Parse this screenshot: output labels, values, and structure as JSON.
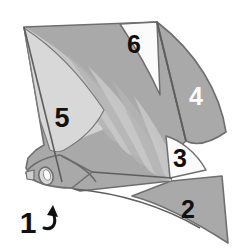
{
  "figure": {
    "background_color": "#ffffff",
    "canvas": {
      "width": 243,
      "height": 249
    }
  },
  "palette": {
    "outline": "#6f6f6f",
    "outline_dark": "#585858",
    "body_mid_gray": "#a9a9a9",
    "body_light_gray": "#d2d2d2",
    "body_lighter_gray": "#dddddd",
    "ray_band_light": "#c9c9c9",
    "ray_band_mid": "#b4b4b4",
    "panel_white": "#fbfbfb",
    "label_dark": "#111111",
    "label_light": "#ffffff",
    "arrow_color": "#111111"
  },
  "labels": [
    {
      "id": "label-1",
      "text": "1",
      "x": 28,
      "y": 225,
      "font_size": 30,
      "color": "#111111",
      "region": "oval-feature",
      "has_arrow": true
    },
    {
      "id": "label-2",
      "text": "2",
      "x": 188,
      "y": 211,
      "font_size": 25,
      "color": "#111111",
      "region": "lower-right-lobe",
      "has_arrow": false
    },
    {
      "id": "label-3",
      "text": "3",
      "x": 180,
      "y": 160,
      "font_size": 25,
      "color": "#111111",
      "region": "white-wedge-notch",
      "has_arrow": false
    },
    {
      "id": "label-4",
      "text": "4",
      "x": 196,
      "y": 98,
      "font_size": 25,
      "color": "#ffffff",
      "region": "right-lobe",
      "has_arrow": false
    },
    {
      "id": "label-5",
      "text": "5",
      "x": 62,
      "y": 120,
      "font_size": 27,
      "color": "#111111",
      "region": "left-light-band",
      "has_arrow": false
    },
    {
      "id": "label-6",
      "text": "6",
      "x": 134,
      "y": 46,
      "font_size": 25,
      "color": "#111111",
      "region": "upper-light-panel",
      "has_arrow": false
    }
  ],
  "arrow": {
    "name": "callout-arrow-1",
    "path": "M 44 228 C 54 231 57 222 53 213",
    "head_points": "53,205 58,217 47,215",
    "color": "#111111",
    "stroke_width": 3
  },
  "shapes": {
    "main_body": {
      "name": "main-body-outline",
      "path": "M 24 27 L 157 22 L 186 141 L 176 150 L 171 181 L 80 191 L 54 182 L 32 177 L 26 168 L 28 158 L 36 150 L 44 145 L 24 27 Z",
      "fill": "#a9a9a9"
    },
    "left_panel": {
      "name": "left-light-panel",
      "path": "M 24 27 C 56 45 92 78 122 122 L 52 150 Z",
      "fill": "#d2d2d2"
    },
    "upper_panel": {
      "name": "upper-light-panel",
      "path": "M 120 24 L 157 22 L 160 95 C 146 64 132 42 120 24 Z",
      "fill": "#fbfbfb"
    },
    "right_lobe": {
      "name": "right-lobe",
      "path": "M 157 22 C 196 52 220 92 226 132 C 210 143 196 146 186 141 Z",
      "fill": "#a9a9a9"
    },
    "lower_right_lobe": {
      "name": "lower-right-lobe",
      "path": "M 171 181 L 222 176 L 228 243 C 200 225 166 205 132 196 Z",
      "fill": "#a9a9a9"
    },
    "white_wedge": {
      "name": "white-wedge-notch",
      "path": "M 166 136 C 180 140 196 152 206 170 L 170 178 Z",
      "fill": "#fbfbfb"
    },
    "head_lobe": {
      "name": "head-lobe",
      "path": "M 60 155 C 44 157 30 165 26 173 C 31 182 50 188 72 188 L 92 172 Z",
      "fill": "#a9a9a9"
    },
    "oval_feature": {
      "name": "oval-feature",
      "cx": 46,
      "cy": 176,
      "rx": 7,
      "ry": 9,
      "fill": "#d8d8d8",
      "inner_fill": "#fbfbfb"
    }
  },
  "ray_bands": {
    "name": "radiating-ray-bands",
    "origin_x": 30,
    "origin_y": 186,
    "count": 7,
    "fill_light": "#c9c9c9",
    "paths": [
      "M 26 30 C 64 48 102 84 128 130 C 112 132 98 128 90 118 C 70 88 46 56 26 30 Z",
      "M 34 36 C 76 60 114 100 138 144 C 126 148 114 144 106 134 C 86 102 58 64 34 36 Z",
      "M 48 44 C 92 74 128 116 150 156 C 138 160 128 156 120 146 C 100 114 72 74 48 44 Z",
      "M 66 54 C 108 88 140 128 160 166 C 150 170 140 166 132 156 C 114 124 90 86 66 54 Z",
      "M 88 66 C 124 100 152 140 168 174 C 158 178 150 174 144 164 C 128 134 108 98 88 66 Z",
      "M 112 80 C 142 112 164 148 176 180 C 168 184 160 180 154 172 C 142 144 126 110 112 80 Z",
      "M 134 96 C 156 124 172 154 182 182 C 174 186 168 182 164 174 C 156 150 144 120 134 96 Z"
    ]
  }
}
